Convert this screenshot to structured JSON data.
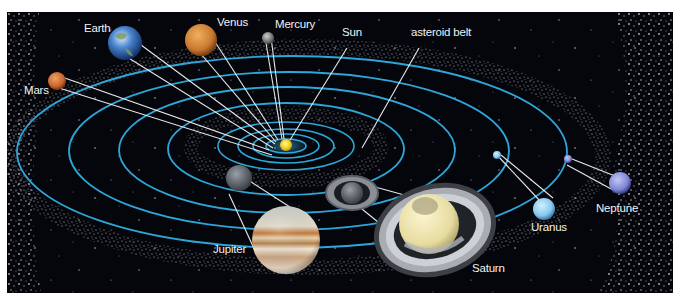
{
  "diagram": {
    "type": "solar-system",
    "background_color": "#04060c",
    "orbit_color": "#2fa6d8",
    "belt_color": "#d8d8d8",
    "labels": {
      "sun": "Sun",
      "mercury": "Mercury",
      "venus": "Venus",
      "earth": "Earth",
      "mars": "Mars",
      "asteroid_belt": "asteroid belt",
      "jupiter": "Jupiter",
      "saturn": "Saturn",
      "uranus": "Uranus",
      "neptune": "Neptune"
    },
    "bodies": [
      {
        "name": "Sun",
        "color": "#f4d21a"
      },
      {
        "name": "Mercury",
        "color": "#8a8a8a"
      },
      {
        "name": "Venus",
        "color": "#c9792e"
      },
      {
        "name": "Earth",
        "color": "#3b73c4"
      },
      {
        "name": "Mars",
        "color": "#c8652e"
      },
      {
        "name": "Jupiter",
        "color": "#d9c8a8"
      },
      {
        "name": "Saturn",
        "color": "#efe6b0"
      },
      {
        "name": "Uranus",
        "color": "#8fcdf0"
      },
      {
        "name": "Neptune",
        "color": "#7f86d6"
      }
    ]
  }
}
